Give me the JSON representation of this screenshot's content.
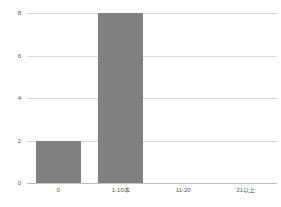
{
  "chart_data": {
    "type": "bar",
    "title": "",
    "subtitle": "",
    "xlabel": "",
    "ylabel": "",
    "categories": [
      "0",
      "1-10本",
      "11-20",
      "21以上"
    ],
    "values": [
      2,
      8,
      0,
      0
    ],
    "ylim": [
      0,
      8
    ],
    "yticks": [
      0,
      2,
      4,
      6,
      8
    ],
    "ytick_labels": [
      "0",
      "2",
      "4",
      "6",
      "8"
    ],
    "grid": true,
    "grid_axis": "y",
    "legend": false,
    "legend_position": "none",
    "series": [
      {
        "name": "",
        "values": [
          2,
          8,
          0,
          0
        ]
      }
    ],
    "annotations": []
  },
  "style": {
    "bar_color": "#808080",
    "grid_color": "#d9d9d9",
    "baseline_color": "#bfbfbf",
    "tick_label_color": "#595959",
    "background_color": "#ffffff"
  }
}
